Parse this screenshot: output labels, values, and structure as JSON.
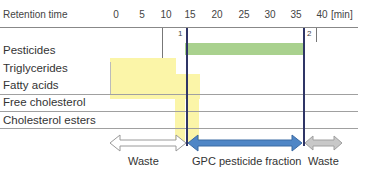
{
  "header": {
    "axis_label": "Retention time",
    "ticks": [
      "0",
      "5",
      "10",
      "15",
      "20",
      "25",
      "30",
      "35",
      "40"
    ],
    "unit": "[min]"
  },
  "rows": [
    {
      "label": "Pesticides",
      "start": 13,
      "end": 36,
      "color": "#a9d18e"
    },
    {
      "label": "Triglycerides",
      "start": 0,
      "end": 13,
      "color": "#fbf5a8"
    },
    {
      "label": "Fatty acids",
      "start": 0,
      "end": 16,
      "color": "#fbf5a8"
    },
    {
      "label": "Free cholesterol",
      "start": 13,
      "end": 17,
      "color": "#fbf5a8"
    },
    {
      "label": "Cholesterol esters",
      "start": 13,
      "end": 17,
      "color": "#fbf5a8"
    }
  ],
  "markers": [
    {
      "label": "1",
      "time": 14.5
    },
    {
      "label": "2",
      "time": 36
    }
  ],
  "fractions": [
    {
      "label": "Waste",
      "from": 0,
      "to": 14.5,
      "color": "#ffffff"
    },
    {
      "label": "GPC pesticide fraction",
      "from": 14.5,
      "to": 36,
      "color": "#4f86c6"
    },
    {
      "label": "Waste",
      "from": 36,
      "to": 41,
      "color": "#c8c8c8"
    }
  ],
  "colors": {
    "cut_line": "#2f3566",
    "pesticide_bar": "#a9d18e",
    "matrix_bar": "#fbf5a8",
    "fraction_arrow": "#4f86c6",
    "waste_arrow_gray": "#c8c8c8"
  }
}
